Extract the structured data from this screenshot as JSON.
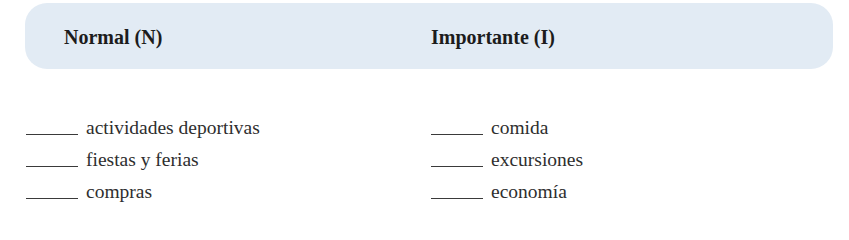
{
  "header": {
    "background_color": "#e2ebf4",
    "columns": [
      {
        "label": "Normal (N)"
      },
      {
        "label": "Importante (I)"
      }
    ]
  },
  "lists": {
    "normal": {
      "items": [
        {
          "blank": "",
          "label": "actividades deportivas"
        },
        {
          "blank": "",
          "label": "fiestas y ferias"
        },
        {
          "blank": "",
          "label": "compras"
        }
      ]
    },
    "importante": {
      "items": [
        {
          "blank": "",
          "label": "comida"
        },
        {
          "blank": "",
          "label": "excursiones"
        },
        {
          "blank": "",
          "label": "economía"
        }
      ]
    }
  }
}
